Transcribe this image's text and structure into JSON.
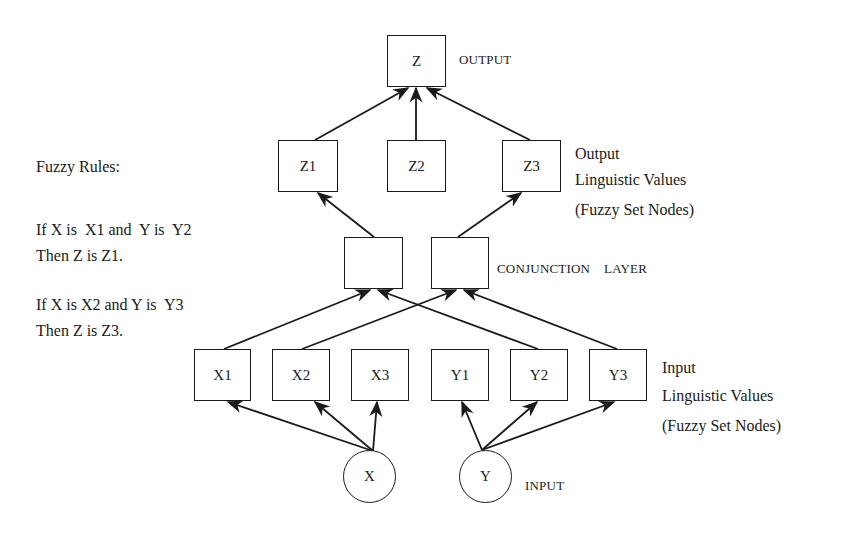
{
  "diagram": {
    "type": "fuzzy-neural-network",
    "output_node": {
      "label": "Z",
      "caption": "OUTPUT"
    },
    "output_values": {
      "nodes": [
        "Z1",
        "Z2",
        "Z3"
      ],
      "caption": [
        "Output",
        "Linguistic Values",
        "(Fuzzy Set Nodes)"
      ]
    },
    "conjunction_layer": {
      "nodes": [
        "",
        ""
      ],
      "caption": "CONJUNCTION    LAYER"
    },
    "input_values": {
      "nodes": [
        "X1",
        "X2",
        "X3",
        "Y1",
        "Y2",
        "Y3"
      ],
      "caption": [
        "Input",
        "Linguistic Values",
        "(Fuzzy Set Nodes)"
      ]
    },
    "input_nodes": {
      "nodes": [
        "X",
        "Y"
      ],
      "caption": "INPUT"
    },
    "fuzzy_rules": {
      "title": "Fuzzy Rules:",
      "rules": [
        {
          "if": "If X is  X1 and  Y is  Y2",
          "then": "Then Z is Z1."
        },
        {
          "if": "If X is X2 and Y is  Y3",
          "then": "Then Z is Z3."
        }
      ]
    },
    "edges": [
      {
        "from": "X",
        "to": "X1"
      },
      {
        "from": "X",
        "to": "X2"
      },
      {
        "from": "X",
        "to": "X3"
      },
      {
        "from": "Y",
        "to": "Y1"
      },
      {
        "from": "Y",
        "to": "Y2"
      },
      {
        "from": "Y",
        "to": "Y3"
      },
      {
        "from": "X1",
        "to": "Conjunction1"
      },
      {
        "from": "Y2",
        "to": "Conjunction1"
      },
      {
        "from": "X2",
        "to": "Conjunction2"
      },
      {
        "from": "Y3",
        "to": "Conjunction2"
      },
      {
        "from": "Conjunction1",
        "to": "Z1"
      },
      {
        "from": "Conjunction2",
        "to": "Z3"
      },
      {
        "from": "Z1",
        "to": "Z"
      },
      {
        "from": "Z2",
        "to": "Z"
      },
      {
        "from": "Z3",
        "to": "Z"
      }
    ]
  }
}
